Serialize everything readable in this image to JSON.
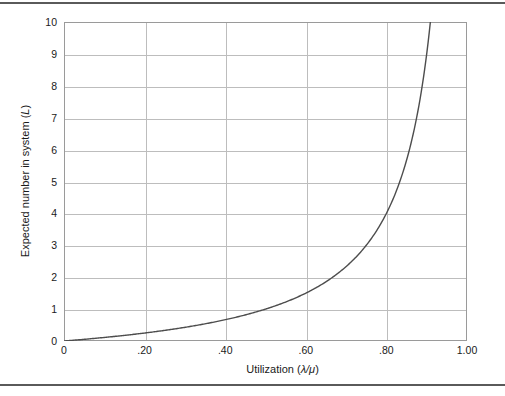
{
  "figure": {
    "top_rule": "horizontal-rule",
    "bottom_rule": "horizontal-rule"
  },
  "chart_data": {
    "type": "line",
    "title": "",
    "xlabel": "Utilization (λ/μ)",
    "ylabel": "Expected number in system (L)",
    "ylabel_plain": "Expected number in system",
    "ylabel_symbol": "L",
    "xlabel_plain": "Utilization",
    "xlabel_symbol": "λ/μ",
    "xlim": [
      0,
      1.0
    ],
    "ylim": [
      0,
      10
    ],
    "grid": true,
    "legend": null,
    "xticks": [
      0,
      0.2,
      0.4,
      0.6,
      0.8,
      1.0
    ],
    "xticklabels": [
      "0",
      ".20",
      ".40",
      ".60",
      ".80",
      "1.00"
    ],
    "yticks": [
      0,
      1,
      2,
      3,
      4,
      5,
      6,
      7,
      8,
      9,
      10
    ],
    "yticklabels": [
      "0",
      "1",
      "2",
      "3",
      "4",
      "5",
      "6",
      "7",
      "8",
      "9",
      "10"
    ],
    "x_gridlines": [
      0.2,
      0.4,
      0.6,
      0.8
    ],
    "y_gridlines": [
      1,
      2,
      3,
      4,
      5,
      6,
      7,
      8,
      9
    ],
    "series": [
      {
        "name": "L = ρ/(1-ρ)",
        "color": "#4d4d4d",
        "x": [
          0,
          0.05,
          0.1,
          0.15,
          0.2,
          0.25,
          0.3,
          0.35,
          0.4,
          0.45,
          0.5,
          0.55,
          0.6,
          0.65,
          0.7,
          0.75,
          0.8,
          0.85,
          0.88,
          0.9,
          0.9091
        ],
        "y": [
          0,
          0.053,
          0.111,
          0.176,
          0.25,
          0.333,
          0.429,
          0.538,
          0.667,
          0.818,
          1.0,
          1.222,
          1.5,
          1.857,
          2.333,
          3.0,
          4.0,
          5.667,
          7.333,
          9.0,
          10.0
        ]
      }
    ],
    "colors": {
      "curve": "#4d4d4d",
      "grid": "#bdbdbd",
      "frame": "#9a9a9a",
      "rule": "#5a5a5a",
      "text": "#1a1a1a",
      "background": "#ffffff"
    }
  }
}
